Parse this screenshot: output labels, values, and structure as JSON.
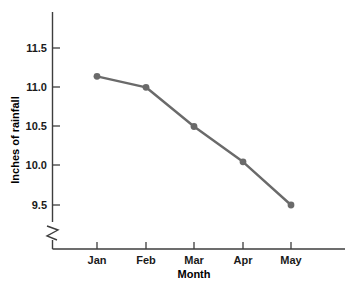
{
  "chart_data": {
    "type": "line",
    "title": "",
    "subtitle": "",
    "xlabel": "Month",
    "ylabel": "Inches of rainfall",
    "categories": [
      "Jan",
      "Feb",
      "Mar",
      "Apr",
      "May"
    ],
    "values": [
      11.14,
      11.0,
      10.5,
      10.05,
      9.5
    ],
    "series": [
      {
        "name": "Inches of rainfall",
        "values": [
          11.14,
          11.0,
          10.5,
          10.05,
          9.5
        ]
      }
    ],
    "ylim": [
      9.5,
      11.5
    ],
    "yticks": [
      9.5,
      10.0,
      10.5,
      11.0,
      11.5
    ],
    "ytick_labels": [
      "9.5",
      "10.0",
      "10.5",
      "11.0",
      "11.5"
    ],
    "xtick_labels": [
      "Jan",
      "Feb",
      "Mar",
      "Apr",
      "May"
    ],
    "grid": false,
    "legend": false,
    "legend_position": "none",
    "axis_break": true,
    "axis_break_axis": "y",
    "marker": "circle",
    "colors": {
      "line": "#6a6a6a",
      "marker": "#6a6a6a",
      "axis": "#3d3d3d",
      "text": "#000000",
      "background": "#ffffff"
    }
  },
  "axes": {
    "y_title": "Inches of rainfall",
    "x_title": "Month",
    "y_tick_0": "9.5",
    "y_tick_1": "10.0",
    "y_tick_2": "10.5",
    "y_tick_3": "11.0",
    "y_tick_4": "11.5",
    "x_tick_0": "Jan",
    "x_tick_1": "Feb",
    "x_tick_2": "Mar",
    "x_tick_3": "Apr",
    "x_tick_4": "May"
  }
}
